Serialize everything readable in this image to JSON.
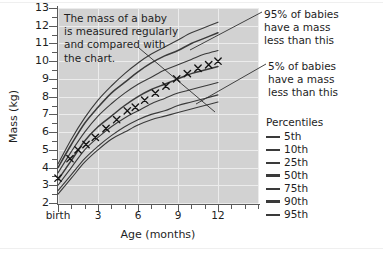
{
  "chart_data": {
    "type": "line",
    "title": "",
    "xlabel": "Age (months)",
    "ylabel": "Mass (kg)",
    "xlim": [
      0,
      15
    ],
    "ylim": [
      2,
      13
    ],
    "grid": true,
    "legend_position": "right",
    "x_tick_labels": [
      "birth",
      "3",
      "6",
      "9",
      "12"
    ],
    "x_tick_values": [
      0,
      3,
      6,
      9,
      12
    ],
    "y_tick_labels": [
      "2",
      "3",
      "4",
      "5",
      "6",
      "7",
      "8",
      "9",
      "10",
      "11",
      "12",
      "13"
    ],
    "y_tick_values": [
      2,
      3,
      4,
      5,
      6,
      7,
      8,
      9,
      10,
      11,
      12,
      13
    ],
    "x": [
      0,
      1,
      2,
      3,
      4,
      5,
      6,
      7,
      8,
      9,
      10,
      11,
      12
    ],
    "series": [
      {
        "name": "5th",
        "values": [
          2.5,
          3.4,
          4.3,
          5.0,
          5.6,
          6.0,
          6.4,
          6.7,
          6.9,
          7.1,
          7.3,
          7.5,
          7.7
        ]
      },
      {
        "name": "10th",
        "values": [
          2.7,
          3.6,
          4.5,
          5.2,
          5.8,
          6.3,
          6.7,
          7.0,
          7.2,
          7.5,
          7.7,
          7.9,
          8.1
        ]
      },
      {
        "name": "25th",
        "values": [
          3.0,
          4.0,
          5.0,
          5.7,
          6.3,
          6.8,
          7.2,
          7.6,
          7.9,
          8.2,
          8.4,
          8.6,
          8.8
        ]
      },
      {
        "name": "50th",
        "values": [
          3.3,
          4.4,
          5.5,
          6.3,
          6.9,
          7.5,
          8.0,
          8.4,
          8.7,
          9.0,
          9.3,
          9.5,
          9.7
        ]
      },
      {
        "name": "75th",
        "values": [
          3.7,
          4.9,
          6.0,
          6.9,
          7.6,
          8.2,
          8.7,
          9.1,
          9.5,
          9.8,
          10.1,
          10.4,
          10.6
        ]
      },
      {
        "name": "90th",
        "values": [
          4.0,
          5.3,
          6.5,
          7.4,
          8.2,
          8.8,
          9.4,
          9.9,
          10.3,
          10.6,
          11.0,
          11.3,
          11.6
        ]
      },
      {
        "name": "95th",
        "values": [
          4.2,
          5.6,
          6.8,
          7.8,
          8.6,
          9.3,
          9.9,
          10.4,
          10.8,
          11.2,
          11.6,
          11.9,
          12.2
        ]
      }
    ],
    "measured_points": {
      "name": "measured baby",
      "marker": "x",
      "x": [
        0,
        0.9,
        1.5,
        2.1,
        2.8,
        3.6,
        4.4,
        5.2,
        5.8,
        6.5,
        7.3,
        8.1,
        8.9,
        9.7,
        10.5,
        11.3,
        12.0
      ],
      "y": [
        3.4,
        4.5,
        5.0,
        5.3,
        5.7,
        6.2,
        6.7,
        7.2,
        7.4,
        7.8,
        8.2,
        8.6,
        9.0,
        9.3,
        9.6,
        9.8,
        10.0
      ]
    },
    "annotations": [
      {
        "id": "note",
        "text": "The mass of a baby is measured regularly and compared with the chart."
      },
      {
        "id": "upper",
        "text": "95% of babies have a mass less than this"
      },
      {
        "id": "lower",
        "text": "5% of babies have a mass less than this"
      }
    ]
  },
  "note": {
    "line1": "The mass of a baby",
    "line2": "is measured regularly",
    "line3": "and compared with",
    "line4": "the chart."
  },
  "callout_upper": {
    "line1": "95% of babies",
    "line2": "have a mass",
    "line3": "less than this"
  },
  "callout_lower": {
    "line1": "5% of babies",
    "line2": "have a mass",
    "line3": "less than this"
  },
  "legend": {
    "title": "Percentiles",
    "items": [
      {
        "label": "5th"
      },
      {
        "label": "10th"
      },
      {
        "label": "25th"
      },
      {
        "label": "50th"
      },
      {
        "label": "75th"
      },
      {
        "label": "90th"
      },
      {
        "label": "95th"
      }
    ]
  },
  "axes": {
    "y_title": "Mass (kg)",
    "x_title": "Age (months)",
    "y_labels": [
      "13",
      "12",
      "11",
      "10",
      "9",
      "8",
      "7",
      "6",
      "5",
      "4",
      "3",
      "2"
    ],
    "x_labels": [
      "birth",
      "3",
      "6",
      "9",
      "12"
    ]
  },
  "colors": {
    "plot_background": "#d2d2d2",
    "gridline": "#ececec",
    "curve": "#3a3a3a",
    "axis": "#5a5a5a",
    "text": "#1e1e1e",
    "page_background": "#ffffff"
  }
}
